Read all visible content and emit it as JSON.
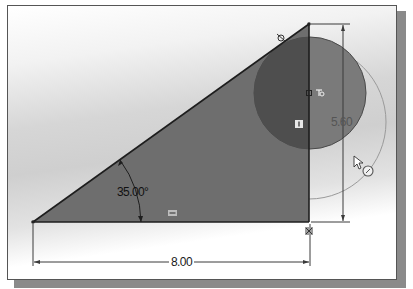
{
  "sketch": {
    "dimensions": {
      "angle": "35.00°",
      "horizontal_length": "8.00",
      "vertical_length": "5.60"
    },
    "relation_icons": {
      "tangent": "tangent-icon",
      "coincident": "coincident-icon",
      "vertical": "vertical-icon",
      "horizontal": "horizontal-icon",
      "fix": "fix-icon"
    },
    "cursor": {
      "icon": "pointer-cursor-icon",
      "mode_icon": "circle-tool-icon"
    },
    "colors": {
      "triangle_fill": "#6e6e6e",
      "inner_circle_fill": "#5a5a5a",
      "outline": "#1e1e1e",
      "outer_circle": "#9a9a9a",
      "dimension_line": "#3a3a3a"
    }
  }
}
